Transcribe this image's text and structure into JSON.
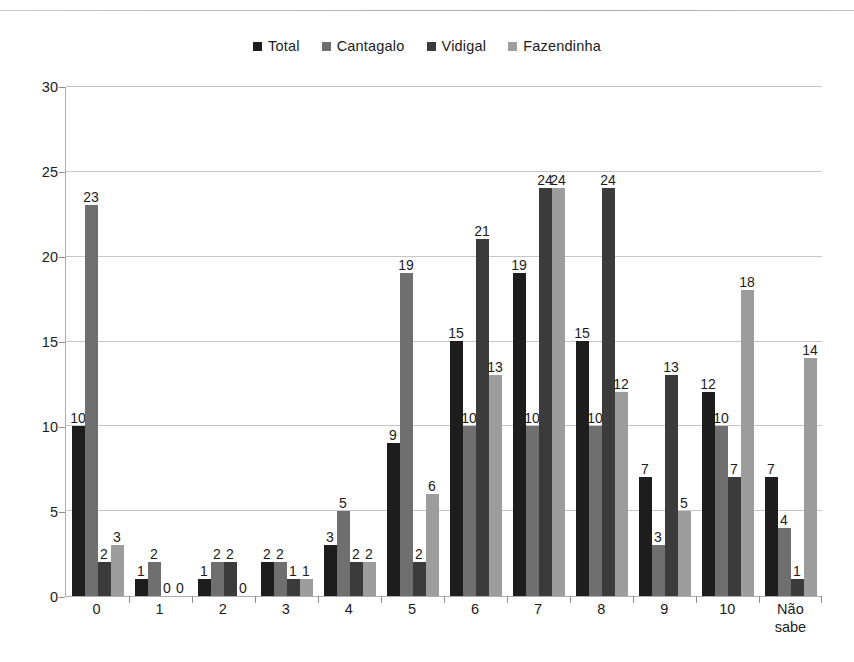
{
  "chart_data": {
    "type": "bar",
    "title": "",
    "subtitle": "",
    "xlabel": "",
    "ylabel": "",
    "ylim": [
      0,
      30
    ],
    "yticks": [
      0,
      5,
      10,
      15,
      20,
      25,
      30
    ],
    "grid": true,
    "legend_position": "top-center",
    "categories": [
      "0",
      "1",
      "2",
      "3",
      "4",
      "5",
      "6",
      "7",
      "8",
      "9",
      "10",
      "Não sabe"
    ],
    "series": [
      {
        "name": "Total",
        "color": "#1d1d1d",
        "values": [
          10,
          1,
          1,
          2,
          3,
          9,
          15,
          19,
          15,
          7,
          12,
          7
        ]
      },
      {
        "name": "Cantagalo",
        "color": "#6f6f6f",
        "values": [
          23,
          2,
          2,
          2,
          5,
          19,
          10,
          10,
          10,
          3,
          10,
          4
        ]
      },
      {
        "name": "Vidigal",
        "color": "#3b3b3b",
        "values": [
          2,
          0,
          2,
          1,
          2,
          2,
          21,
          24,
          24,
          13,
          7,
          1
        ]
      },
      {
        "name": "Fazendinha",
        "color": "#9d9d9d",
        "values": [
          3,
          0,
          0,
          1,
          2,
          6,
          13,
          24,
          12,
          5,
          18,
          14
        ]
      }
    ]
  },
  "legend": {
    "items": [
      {
        "label": "Total",
        "color": "#1d1d1d"
      },
      {
        "label": "Cantagalo",
        "color": "#6f6f6f"
      },
      {
        "label": "Vidigal",
        "color": "#3b3b3b"
      },
      {
        "label": "Fazendinha",
        "color": "#9d9d9d"
      }
    ]
  }
}
